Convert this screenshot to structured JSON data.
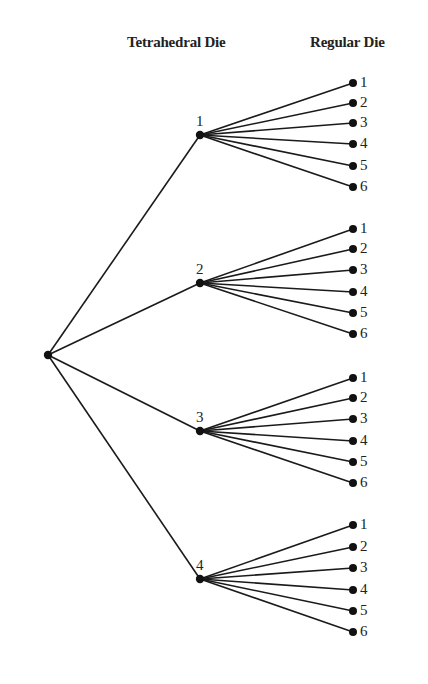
{
  "headers": {
    "tetrahedral": "Tetrahedral Die",
    "regular": "Regular Die"
  },
  "root": {
    "x": 48,
    "y": 355
  },
  "branch_x": 200,
  "leaf_x": 353,
  "branches": [
    {
      "label": "1",
      "y": 135,
      "leaves": [
        {
          "label": "1",
          "y": 83
        },
        {
          "label": "2",
          "y": 103
        },
        {
          "label": "3",
          "y": 123
        },
        {
          "label": "4",
          "y": 144
        },
        {
          "label": "5",
          "y": 166
        },
        {
          "label": "6",
          "y": 187
        }
      ]
    },
    {
      "label": "2",
      "y": 283,
      "leaves": [
        {
          "label": "1",
          "y": 229
        },
        {
          "label": "2",
          "y": 249
        },
        {
          "label": "3",
          "y": 270
        },
        {
          "label": "4",
          "y": 292
        },
        {
          "label": "5",
          "y": 313
        },
        {
          "label": "6",
          "y": 334
        }
      ]
    },
    {
      "label": "3",
      "y": 431,
      "leaves": [
        {
          "label": "1",
          "y": 378
        },
        {
          "label": "2",
          "y": 398
        },
        {
          "label": "3",
          "y": 419
        },
        {
          "label": "4",
          "y": 441
        },
        {
          "label": "5",
          "y": 462
        },
        {
          "label": "6",
          "y": 483
        }
      ]
    },
    {
      "label": "4",
      "y": 579,
      "leaves": [
        {
          "label": "1",
          "y": 525
        },
        {
          "label": "2",
          "y": 547
        },
        {
          "label": "3",
          "y": 568
        },
        {
          "label": "4",
          "y": 590
        },
        {
          "label": "5",
          "y": 611
        },
        {
          "label": "6",
          "y": 632
        }
      ]
    }
  ]
}
